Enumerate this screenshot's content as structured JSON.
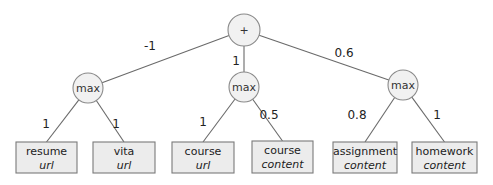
{
  "root": {
    "label": "+",
    "cx": 244,
    "cy": 30,
    "r": 16
  },
  "max_nodes": [
    {
      "id": "max-left",
      "label": "max",
      "cx": 88,
      "cy": 88,
      "r": 15,
      "weight": "-1",
      "weight_x": 150,
      "weight_y": 50
    },
    {
      "id": "max-middle",
      "label": "max",
      "cx": 244,
      "cy": 87,
      "r": 15,
      "weight": "1",
      "weight_x": 236,
      "weight_y": 65
    },
    {
      "id": "max-right",
      "label": "max",
      "cx": 403,
      "cy": 85,
      "r": 15,
      "weight": "0.6",
      "weight_x": 344,
      "weight_y": 57
    }
  ],
  "leaves": [
    {
      "term": "resume",
      "field": "url",
      "x": 16,
      "y": 142,
      "w": 61,
      "h": 31,
      "parent": 0,
      "weight": "1",
      "weight_x": 46,
      "weight_y": 128
    },
    {
      "term": "vita",
      "field": "url",
      "x": 93,
      "y": 142,
      "w": 62,
      "h": 31,
      "parent": 0,
      "weight": "1",
      "weight_x": 116,
      "weight_y": 128
    },
    {
      "term": "course",
      "field": "url",
      "x": 172,
      "y": 142,
      "w": 62,
      "h": 31,
      "parent": 1,
      "weight": "1",
      "weight_x": 203,
      "weight_y": 126
    },
    {
      "term": "course",
      "field": "content",
      "x": 252,
      "y": 141,
      "w": 61,
      "h": 32,
      "parent": 1,
      "weight": "0.5",
      "weight_x": 269,
      "weight_y": 119
    },
    {
      "term": "assignment",
      "field": "content",
      "x": 333,
      "y": 142,
      "w": 64,
      "h": 31,
      "parent": 2,
      "weight": "0.8",
      "weight_x": 357,
      "weight_y": 119
    },
    {
      "term": "homework",
      "field": "content",
      "x": 412,
      "y": 142,
      "w": 65,
      "h": 31,
      "parent": 2,
      "weight": "1",
      "weight_x": 437,
      "weight_y": 119
    }
  ]
}
